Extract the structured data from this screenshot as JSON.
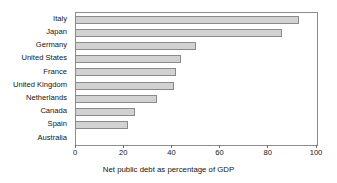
{
  "chart_data": {
    "type": "bar",
    "orientation": "horizontal",
    "title": "",
    "subtitle": "",
    "xlabel": "Net public debt as percentage of GDP",
    "ylabel": "",
    "categories": [
      "Italy",
      "Japan",
      "Germany",
      "United States",
      "France",
      "United Kingdom",
      "Netherlands",
      "Canada",
      "Spain",
      "Australia"
    ],
    "values": [
      93,
      86,
      50,
      44,
      42,
      41,
      34,
      25,
      22,
      0
    ],
    "xlim": [
      0,
      100
    ],
    "xticks": [
      0,
      20,
      40,
      60,
      80,
      100
    ],
    "xtick_labels": [
      "0",
      "20",
      "40",
      "60",
      "80",
      "100"
    ],
    "grid": false,
    "legend": false,
    "legend_position": "none",
    "bar_color": "#d2d2d2",
    "bar_edge_color": "#8a8a8a",
    "frame_color": "#8d8d8d",
    "text_color": "#141414"
  }
}
